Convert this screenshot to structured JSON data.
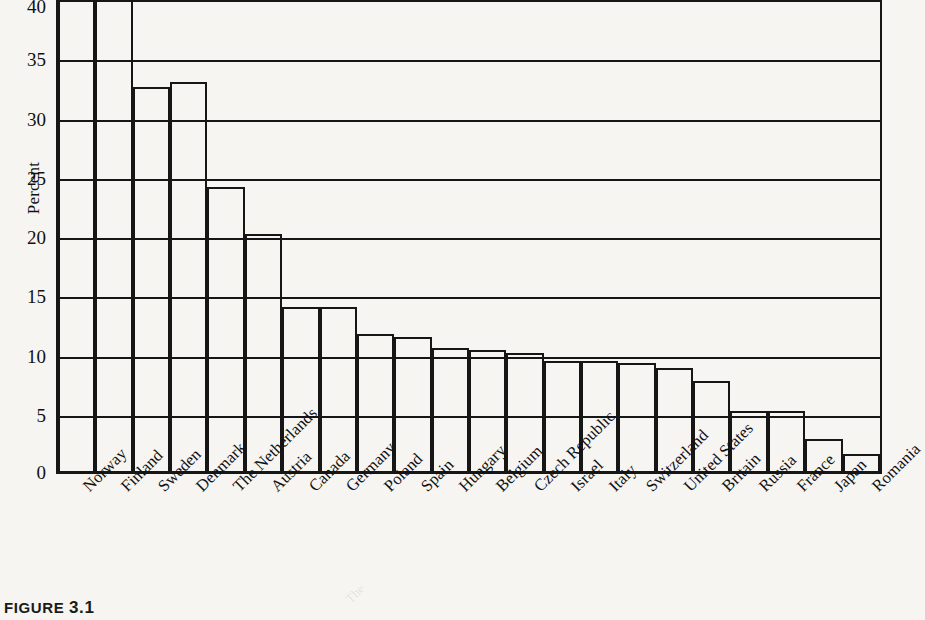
{
  "chart_data": {
    "type": "bar",
    "title": "",
    "xlabel": "",
    "ylabel": "Percent",
    "ylim": [
      0,
      40
    ],
    "yticks": [
      0,
      5,
      10,
      15,
      20,
      25,
      30,
      35,
      40
    ],
    "grid": true,
    "legend": null,
    "note": "Bars for Norway, Finland and Denmark are clipped by the 40 percent axis maximum",
    "categories": [
      "Norway",
      "Finland",
      "Sweden",
      "Denmark",
      "The Netherlands",
      "Austria",
      "Canada",
      "Germany",
      "Poland",
      "Spain",
      "Hungary",
      "Belgium",
      "Czech Republic",
      "Israel",
      "Italy",
      "Switzerland",
      "United States",
      "Britain",
      "Russia",
      "France",
      "Japan",
      "Romania"
    ],
    "values": [
      40.0,
      40.0,
      32.4,
      32.8,
      24.0,
      20.0,
      13.8,
      13.8,
      11.6,
      11.3,
      10.4,
      10.2,
      10.0,
      9.3,
      9.3,
      9.1,
      8.7,
      7.6,
      5.1,
      5.1,
      2.7,
      1.4
    ],
    "clipped": [
      true,
      true,
      false,
      false,
      false,
      false,
      false,
      false,
      false,
      false,
      false,
      false,
      false,
      false,
      false,
      false,
      false,
      false,
      false,
      false,
      false,
      false
    ]
  },
  "caption": {
    "label": "FIGURE",
    "number": "3.1"
  },
  "colors": {
    "ink": "#161616",
    "page": "#f6f5f1",
    "bar_fill": "transparent"
  },
  "ghost_text": {
    "line_top": "The"
  }
}
